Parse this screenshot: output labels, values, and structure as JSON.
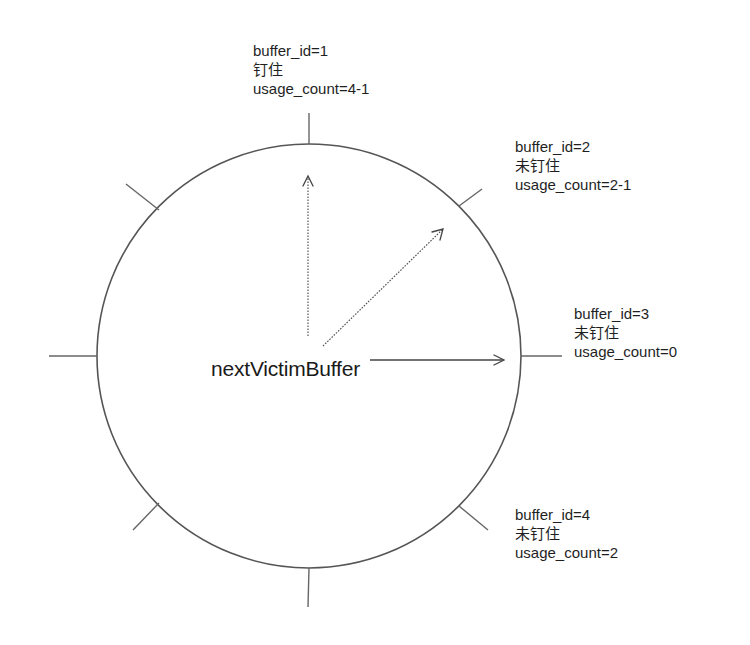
{
  "diagram": {
    "type": "clock-sweep buffer ring",
    "pointer_label": "nextVictimBuffer",
    "colors": {
      "line": "#555555",
      "text": "#1f1f1f",
      "background": "#ffffff"
    },
    "buffers": [
      {
        "id_text": "buffer_id=1",
        "pin_state": "钉住",
        "usage_text": "usage_count=4-1"
      },
      {
        "id_text": "buffer_id=2",
        "pin_state": "未钉住",
        "usage_text": "usage_count=2-1"
      },
      {
        "id_text": "buffer_id=3",
        "pin_state": "未钉住",
        "usage_text": "usage_count=0"
      },
      {
        "id_text": "buffer_id=4",
        "pin_state": "未钉住",
        "usage_text": "usage_count=2"
      }
    ],
    "ring": {
      "slots": 8
    }
  }
}
